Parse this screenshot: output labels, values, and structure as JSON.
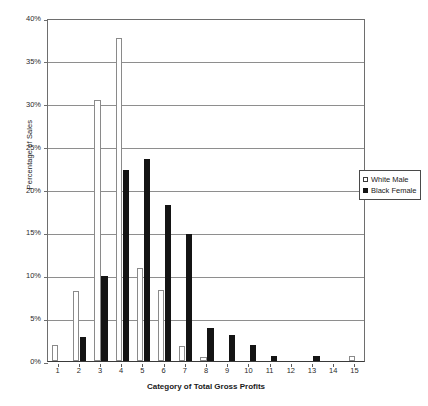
{
  "chart_data": {
    "type": "bar",
    "title": "",
    "xlabel": "Category of Total Gross Profits",
    "ylabel": "Percentage of Sales",
    "categories": [
      "1",
      "2",
      "3",
      "4",
      "5",
      "6",
      "7",
      "8",
      "9",
      "10",
      "11",
      "12",
      "13",
      "14",
      "15"
    ],
    "series": [
      {
        "name": "White Male",
        "color": "#ffffff",
        "values": [
          1.9,
          8.2,
          30.4,
          37.7,
          10.9,
          8.3,
          1.7,
          0.5,
          0.0,
          0.0,
          0.0,
          0.0,
          0.0,
          0.0,
          0.6
        ]
      },
      {
        "name": "Black Female",
        "color": "#141414",
        "values": [
          0.0,
          2.8,
          9.9,
          22.3,
          23.6,
          18.2,
          14.8,
          3.8,
          3.0,
          1.9,
          0.6,
          0.0,
          0.6,
          0.0,
          0.0
        ]
      }
    ],
    "ylim": [
      0,
      40
    ],
    "yticks": [
      0,
      5,
      10,
      15,
      20,
      25,
      30,
      35,
      40
    ],
    "ytick_labels": [
      "0%",
      "5%",
      "10%",
      "15%",
      "20%",
      "25%",
      "30%",
      "35%",
      "40%"
    ],
    "grid": true,
    "grid_axis": "y",
    "legend_position": "right-middle"
  },
  "legend": {
    "entries": [
      {
        "label": "White Male",
        "swatch": "white-square-outline"
      },
      {
        "label": "Black Female",
        "swatch": "black-square-filled"
      }
    ]
  },
  "axes": {
    "y_title": "Percentage of Sales",
    "x_title": "Category of Total Gross Profits"
  }
}
